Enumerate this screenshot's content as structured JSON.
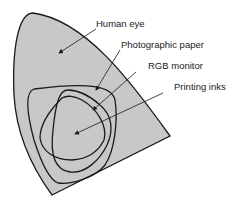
{
  "diagram": {
    "labels": [
      {
        "id": "human-eye",
        "text": "Human eye"
      },
      {
        "id": "photographic-paper",
        "text": "Photographic paper"
      },
      {
        "id": "rgb-monitor",
        "text": "RGB monitor"
      },
      {
        "id": "printing-inks",
        "text": "Printing inks"
      }
    ],
    "colors": {
      "fill": "#c8c8c8",
      "stroke": "#1a1a1a",
      "text": "#222222"
    }
  }
}
